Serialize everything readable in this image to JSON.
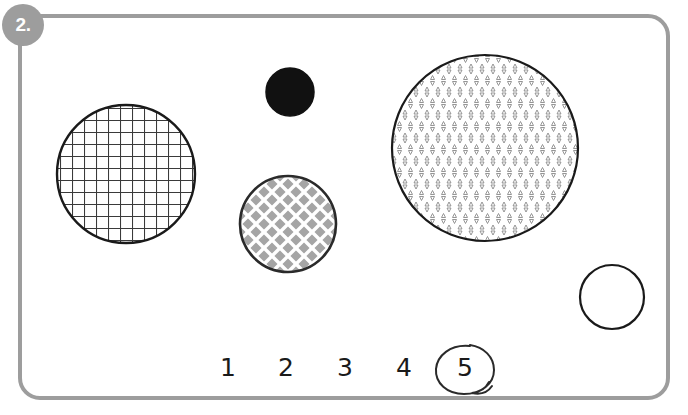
{
  "worksheet": {
    "badge_label": "2.",
    "badge_color": "#9d9d9d",
    "frame_color": "#9d9d9d",
    "background_color": "#ffffff"
  },
  "answer_choices": {
    "items": [
      {
        "label": "1",
        "x": 228,
        "selected": false
      },
      {
        "label": "2",
        "x": 286,
        "selected": false
      },
      {
        "label": "3",
        "x": 345,
        "selected": false
      },
      {
        "label": "4",
        "x": 404,
        "selected": false
      },
      {
        "label": "5",
        "x": 465,
        "selected": true
      }
    ],
    "baseline_y": 353,
    "selected_label": "5",
    "selection_mark": "hand-drawn-circle"
  },
  "shapes": {
    "items": [
      {
        "name": "grid-hatched-circle",
        "fill_pattern": "square-grid",
        "cx": 126,
        "cy": 174,
        "r": 69,
        "stroke": "#1a1a1a",
        "pattern_color": "#3a3a3a",
        "fill": "#ffffff"
      },
      {
        "name": "solid-black-circle",
        "fill_pattern": "solid",
        "cx": 290,
        "cy": 92,
        "r": 24,
        "stroke": "#111111",
        "pattern_color": "#111111",
        "fill": "#111111"
      },
      {
        "name": "diamond-lattice-circle",
        "fill_pattern": "diagonal-lattice",
        "cx": 288,
        "cy": 224,
        "r": 48,
        "stroke": "#2a2a2a",
        "pattern_color": "#ffffff",
        "fill": "#a5a5a5"
      },
      {
        "name": "triangle-tiled-circle",
        "fill_pattern": "alternating-triangles",
        "cx": 485,
        "cy": 148,
        "r": 93,
        "stroke": "#1a1a1a",
        "pattern_color": "#7d7d7d",
        "fill": "#ffffff"
      },
      {
        "name": "empty-outline-circle",
        "fill_pattern": "none",
        "cx": 612,
        "cy": 297,
        "r": 32,
        "stroke": "#1a1a1a",
        "pattern_color": "#ffffff",
        "fill": "#ffffff"
      }
    ]
  }
}
